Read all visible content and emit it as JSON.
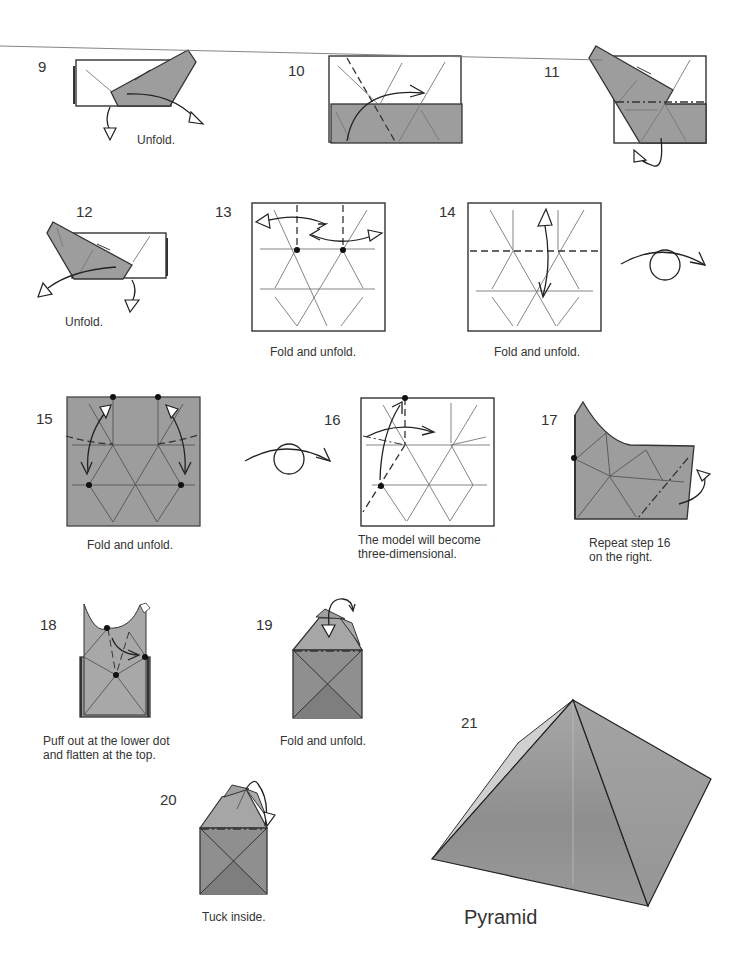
{
  "page": {
    "title": "Pyramid",
    "colors": {
      "background": "#ffffff",
      "paper_color_side": "#9d9d9d",
      "paper_white_side": "#ffffff",
      "line": "#333333"
    }
  },
  "steps": [
    {
      "number": "9",
      "caption": "Unfold."
    },
    {
      "number": "10",
      "caption": ""
    },
    {
      "number": "11",
      "caption": ""
    },
    {
      "number": "12",
      "caption": "Unfold."
    },
    {
      "number": "13",
      "caption": "Fold and unfold."
    },
    {
      "number": "14",
      "caption": "Fold and unfold.",
      "extra_symbol": "turn-over-icon"
    },
    {
      "number": "15",
      "caption": "Fold and unfold.",
      "extra_symbol": "turn-over-icon"
    },
    {
      "number": "16",
      "caption_line1": "The model will become",
      "caption_line2": "three-dimensional."
    },
    {
      "number": "17",
      "caption_line1": "Repeat step 16",
      "caption_line2": "on the right."
    },
    {
      "number": "18",
      "caption_line1": "Puff out at the lower dot",
      "caption_line2": "and flatten at the top."
    },
    {
      "number": "19",
      "caption": "Fold and unfold."
    },
    {
      "number": "20",
      "caption": "Tuck inside."
    },
    {
      "number": "21",
      "caption": "Pyramid"
    }
  ]
}
